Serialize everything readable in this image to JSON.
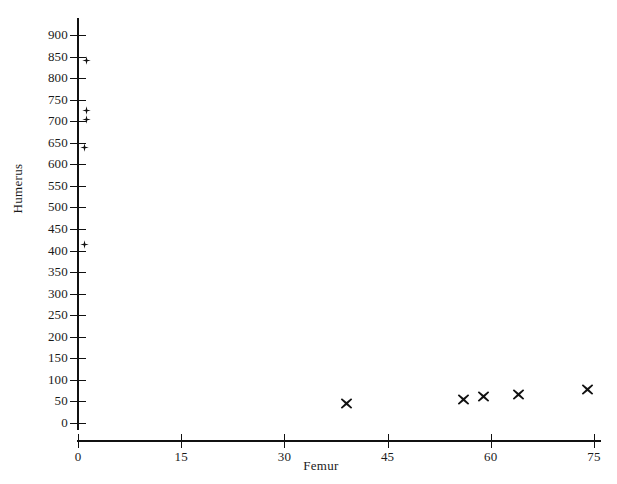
{
  "chart_data": {
    "type": "scatter",
    "title": "",
    "xlabel": "Femur",
    "ylabel": "Humerus",
    "xlim": [
      0,
      78
    ],
    "ylim": [
      0,
      910
    ],
    "xticks": [
      0,
      15,
      30,
      45,
      60,
      75
    ],
    "yticks": [
      0,
      50,
      100,
      150,
      200,
      250,
      300,
      350,
      400,
      450,
      500,
      550,
      600,
      650,
      700,
      750,
      800,
      850,
      900
    ],
    "grid": false,
    "legend": "none",
    "series": [
      {
        "name": "series-1",
        "marker": "plus",
        "color": "#111111",
        "points": [
          {
            "x": 1.3,
            "y": 840
          },
          {
            "x": 1.3,
            "y": 726
          },
          {
            "x": 1.3,
            "y": 703
          },
          {
            "x": 1.0,
            "y": 638
          },
          {
            "x": 1.0,
            "y": 415
          }
        ]
      },
      {
        "name": "series-2",
        "marker": "cross",
        "color": "#111111",
        "points": [
          {
            "x": 39,
            "y": 45
          },
          {
            "x": 56,
            "y": 55
          },
          {
            "x": 59,
            "y": 62
          },
          {
            "x": 64,
            "y": 65
          },
          {
            "x": 74,
            "y": 78
          }
        ]
      }
    ]
  }
}
